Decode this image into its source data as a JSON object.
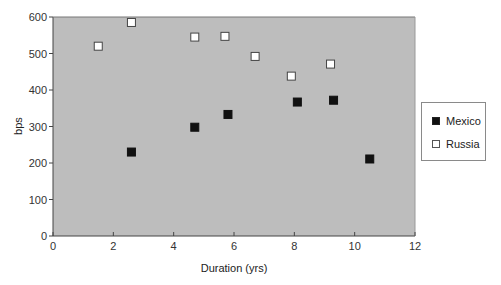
{
  "chart_data": {
    "type": "scatter",
    "title": "",
    "xlabel": "Duration (yrs)",
    "ylabel": "bps",
    "xlim": [
      0,
      12
    ],
    "ylim": [
      0,
      600
    ],
    "xticks": [
      0,
      2,
      4,
      6,
      8,
      10,
      12
    ],
    "yticks": [
      0,
      100,
      200,
      300,
      400,
      500,
      600
    ],
    "grid": false,
    "legend_position": "right",
    "plot_background": "#bdbdbd",
    "series": [
      {
        "name": "Mexico",
        "marker": "filled-square",
        "color": "#111111",
        "points": [
          {
            "x": 2.6,
            "y": 230
          },
          {
            "x": 4.7,
            "y": 298
          },
          {
            "x": 5.8,
            "y": 333
          },
          {
            "x": 8.1,
            "y": 367
          },
          {
            "x": 9.3,
            "y": 372
          },
          {
            "x": 10.5,
            "y": 211
          }
        ]
      },
      {
        "name": "Russia",
        "marker": "hollow-square",
        "color": "#ffffff",
        "points": [
          {
            "x": 1.5,
            "y": 520
          },
          {
            "x": 2.6,
            "y": 585
          },
          {
            "x": 4.7,
            "y": 545
          },
          {
            "x": 5.7,
            "y": 547
          },
          {
            "x": 6.7,
            "y": 492
          },
          {
            "x": 7.9,
            "y": 438
          },
          {
            "x": 9.2,
            "y": 471
          }
        ]
      }
    ]
  },
  "legend": {
    "items": [
      {
        "label": "Mexico"
      },
      {
        "label": "Russia"
      }
    ]
  }
}
